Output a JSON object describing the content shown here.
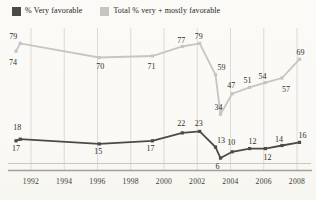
{
  "chart_data": {
    "type": "line",
    "title": "",
    "xlabel": "",
    "ylabel": "",
    "grid": "vertical-only",
    "legend_position": "top-left",
    "x_tick_labels": [
      "1992",
      "1994",
      "1996",
      "1998",
      "2000",
      "2002",
      "2004",
      "2006",
      "2008"
    ],
    "x_tick_years": [
      1992,
      1994,
      1996,
      1998,
      2000,
      2002,
      2004,
      2006,
      2008
    ],
    "x_range": [
      1990.2,
      2009.2
    ],
    "ylim": [
      0,
      88
    ],
    "series": [
      {
        "name": "% Very favorable",
        "color": "#4b4a47",
        "values": [
          17,
          18,
          15,
          17,
          22,
          23,
          13,
          6,
          10,
          12,
          12,
          14,
          16
        ],
        "points": [
          {
            "x": 1991.1,
            "v": 17,
            "dx": 0,
            "dy": 10
          },
          {
            "x": 1991.35,
            "v": 18,
            "dx": -3,
            "dy": -9
          },
          {
            "x": 1996.1,
            "v": 15,
            "dx": -1,
            "dy": 10
          },
          {
            "x": 1999.3,
            "v": 17,
            "dx": -2,
            "dy": 10
          },
          {
            "x": 2001.1,
            "v": 22,
            "dx": -1,
            "dy": -6.5
          },
          {
            "x": 2002.15,
            "v": 23,
            "dx": -1,
            "dy": -5.5
          },
          {
            "x": 2003.1,
            "v": 13,
            "dx": 5.5,
            "dy": -4
          },
          {
            "x": 2003.4,
            "v": 6,
            "dx": -3,
            "dy": 11
          },
          {
            "x": 2004.1,
            "v": 10,
            "dx": -1,
            "dy": -6.5
          },
          {
            "x": 2005.15,
            "v": 12,
            "dx": 3,
            "dy": -5
          },
          {
            "x": 2006.1,
            "v": 12,
            "dx": 2,
            "dy": 11
          },
          {
            "x": 2007.1,
            "v": 14,
            "dx": -3,
            "dy": -3.5
          },
          {
            "x": 2008.15,
            "v": 16,
            "dx": 3,
            "dy": -4
          }
        ]
      },
      {
        "name": "Total % very + mostly favorable",
        "color": "#c6c5c1",
        "values": [
          74,
          79,
          70,
          71,
          77,
          79,
          59,
          34,
          47,
          51,
          54,
          57,
          69
        ],
        "points": [
          {
            "x": 1991.1,
            "v": 74,
            "dx": -3,
            "dy": 13.5
          },
          {
            "x": 1991.35,
            "v": 79,
            "dx": -7,
            "dy": -4.5
          },
          {
            "x": 1996.1,
            "v": 70,
            "dx": 1,
            "dy": 11
          },
          {
            "x": 1999.3,
            "v": 71,
            "dx": -1,
            "dy": 13
          },
          {
            "x": 2001.1,
            "v": 77,
            "dx": -1,
            "dy": -3.5
          },
          {
            "x": 2002.15,
            "v": 79,
            "dx": -1,
            "dy": -4
          },
          {
            "x": 2003.1,
            "v": 59,
            "dx": 6,
            "dy": -4.5
          },
          {
            "x": 2003.4,
            "v": 34,
            "dx": -2,
            "dy": -4.5
          },
          {
            "x": 2004.1,
            "v": 47,
            "dx": -1,
            "dy": -5.5
          },
          {
            "x": 2005.15,
            "v": 51,
            "dx": -2,
            "dy": -4.5
          },
          {
            "x": 2006.1,
            "v": 54,
            "dx": -3,
            "dy": -3.5
          },
          {
            "x": 2007.1,
            "v": 57,
            "dx": 4,
            "dy": 14
          },
          {
            "x": 2008.15,
            "v": 69,
            "dx": 1,
            "dy": -4
          }
        ]
      }
    ],
    "colors": {
      "background": "#fbfaf7",
      "gridline": "#dcdad5",
      "axis_thin": "#c9c7c2",
      "axis_heavy": "#a19f99",
      "label_text": "#2f2e2c",
      "tick_text": "#3c3b38"
    }
  }
}
